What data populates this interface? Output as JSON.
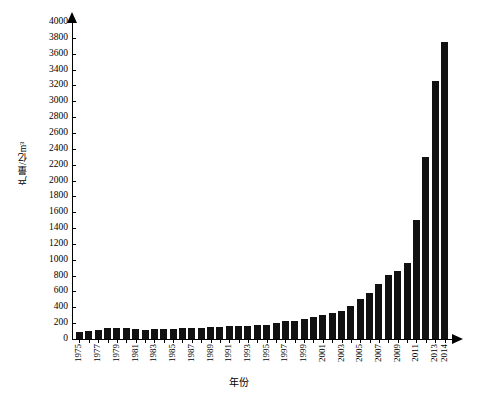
{
  "chart_data": {
    "type": "bar",
    "title": "",
    "xlabel": "年份",
    "ylabel": "产量/亿m³",
    "ylim": [
      0,
      4000
    ],
    "ytick_step": 200,
    "yticks": [
      0,
      200,
      400,
      600,
      800,
      1000,
      1200,
      1400,
      1600,
      1800,
      2000,
      2200,
      2400,
      2600,
      2800,
      3000,
      3200,
      3400,
      3600,
      3800,
      4000
    ],
    "grid": false,
    "legend": null,
    "bar_color": "#111111",
    "categories": [
      "1975",
      "1976",
      "1977",
      "1978",
      "1979",
      "1980",
      "1981",
      "1982",
      "1983",
      "1984",
      "1985",
      "1986",
      "1987",
      "1988",
      "1989",
      "1990",
      "1991",
      "1992",
      "1993",
      "1994",
      "1995",
      "1996",
      "1997",
      "1998",
      "1999",
      "2000",
      "2001",
      "2002",
      "2003",
      "2004",
      "2005",
      "2006",
      "2007",
      "2008",
      "2009",
      "2010",
      "2011",
      "2012",
      "2013",
      "2014"
    ],
    "tick_labels": [
      "1975",
      "",
      "1977",
      "",
      "1979",
      "",
      "1981",
      "",
      "1983",
      "",
      "1985",
      "",
      "1987",
      "",
      "1989",
      "",
      "1991",
      "",
      "1993",
      "",
      "1995",
      "",
      "1997",
      "",
      "1999",
      "",
      "2001",
      "",
      "2003",
      "",
      "2005",
      "",
      "2007",
      "",
      "2009",
      "",
      "2011",
      "",
      "2013",
      "2014"
    ],
    "values": [
      89,
      101,
      121,
      137,
      145,
      143,
      127,
      119,
      123,
      125,
      129,
      138,
      139,
      143,
      150,
      153,
      160,
      158,
      167,
      175,
      179,
      201,
      227,
      233,
      252,
      272,
      303,
      327,
      350,
      415,
      500,
      586,
      692,
      803,
      852,
      957,
      1031,
      1072,
      1209,
      1302
    ],
    "values_scaled": [
      89,
      101,
      121,
      137,
      145,
      143,
      127,
      119,
      123,
      125,
      129,
      138,
      139,
      143,
      150,
      153,
      160,
      158,
      167,
      175,
      179,
      201,
      227,
      233,
      252,
      272,
      303,
      327,
      350,
      415,
      500,
      586,
      692,
      803,
      852,
      957,
      1500,
      2300,
      3250,
      3750
    ],
    "plot_values": [
      90,
      100,
      120,
      135,
      145,
      143,
      127,
      120,
      123,
      125,
      130,
      138,
      140,
      143,
      150,
      153,
      160,
      158,
      167,
      175,
      180,
      200,
      227,
      233,
      252,
      272,
      303,
      327,
      350,
      415,
      500,
      586,
      692,
      803,
      852,
      957,
      1500,
      2300,
      3250,
      3750
    ]
  },
  "axis": {
    "y_title": "产量/亿m³",
    "x_title": "年份"
  }
}
